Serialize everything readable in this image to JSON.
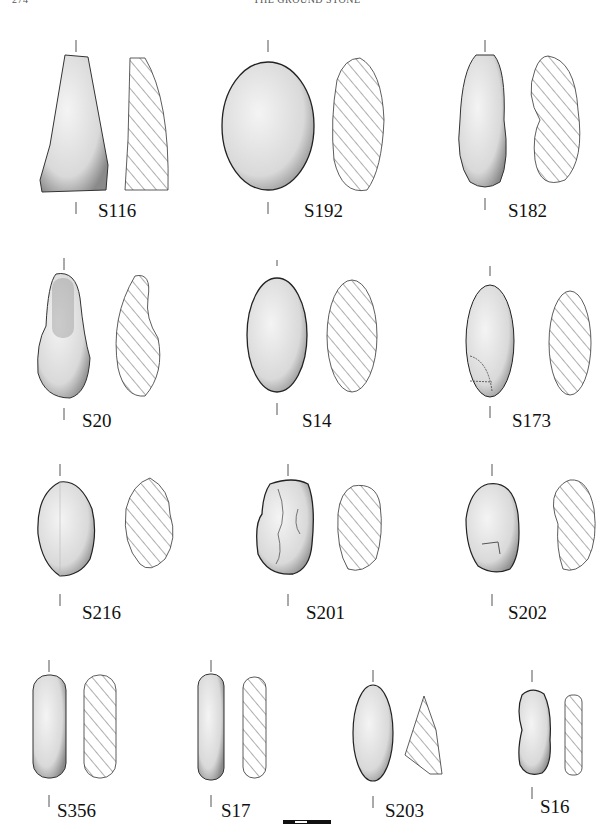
{
  "page": {
    "page_number": "274",
    "running_title": "THE GROUND STONE"
  },
  "figure": {
    "rows": [
      {
        "items": [
          {
            "id": "S116"
          },
          {
            "id": "S192"
          },
          {
            "id": "S182"
          }
        ]
      },
      {
        "items": [
          {
            "id": "S20"
          },
          {
            "id": "S14"
          },
          {
            "id": "S173"
          }
        ]
      },
      {
        "items": [
          {
            "id": "S216"
          },
          {
            "id": "S201"
          },
          {
            "id": "S202"
          }
        ]
      },
      {
        "items": [
          {
            "id": "S356"
          },
          {
            "id": "S17"
          },
          {
            "id": "S203"
          },
          {
            "id": "S16"
          }
        ]
      }
    ],
    "scale_bar": {
      "segments": 4
    }
  }
}
